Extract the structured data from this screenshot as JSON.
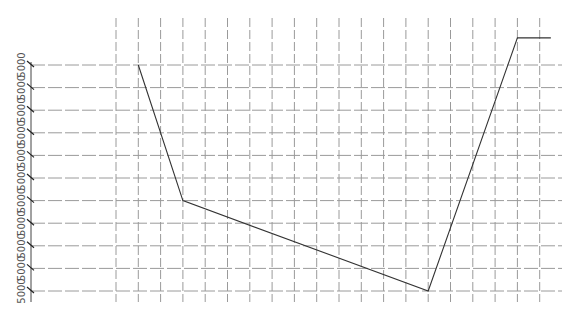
{
  "chart_data": {
    "type": "line",
    "title": "",
    "xlabel": "",
    "ylabel": "",
    "y_tick_labels": [
      "5000",
      "5000",
      "5000",
      "5000",
      "5000",
      "5000",
      "5000",
      "5000",
      "5000",
      "5000",
      "5000"
    ],
    "grid": true,
    "grid_style": "dashed",
    "x_grid_count": 20,
    "y_grid_count": 11,
    "legend": null,
    "series": [
      {
        "name": "series-1",
        "color": "#333333",
        "x": [
          1,
          3,
          14,
          18,
          19.5
        ],
        "y": [
          10,
          4,
          0,
          11.2,
          11.2
        ]
      }
    ],
    "ylim": [
      0,
      11.2
    ]
  },
  "colors": {
    "line": "#333333",
    "grid": "#9a9a9a",
    "axis": "#444444"
  }
}
